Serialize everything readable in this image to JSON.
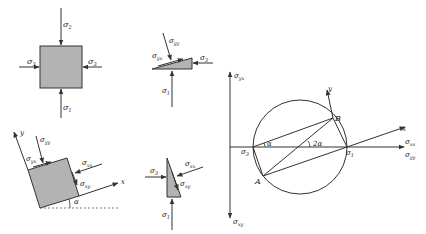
{
  "colors": {
    "stroke": "#333333",
    "fill": "#b3b3b3",
    "background": "#ffffff"
  },
  "panel_a": {
    "top_label": "σ",
    "top_sub": "2",
    "bottom_label": "σ",
    "bottom_sub": "1",
    "left_label": "σ",
    "left_sub": "3",
    "right_label": "σ",
    "right_sub": "3"
  },
  "panel_b": {
    "shear_label": "σ",
    "shear_sub": "yx",
    "normal_label": "σ",
    "normal_sub": "yy",
    "right_label": "σ",
    "right_sub": "3",
    "bottom_label": "σ",
    "bottom_sub": "1"
  },
  "panel_c": {
    "axis_y": "y",
    "axis_x": "x",
    "yy_label": "σ",
    "yy_sub": "yy",
    "yx_label": "σ",
    "yx_sub": "yx",
    "xx_label": "σ",
    "xx_sub": "xx",
    "xy_label": "σ",
    "xy_sub": "xy",
    "angle": "α"
  },
  "panel_d": {
    "left_label": "σ",
    "left_sub": "3",
    "xx_label": "σ",
    "xx_sub": "xx",
    "xy_label": "σ",
    "xy_sub": "xy",
    "bottom_label": "σ",
    "bottom_sub": "1"
  },
  "mohr": {
    "vert_top_label": "σ",
    "vert_top_sub": "yx",
    "vert_bottom_label": "σ",
    "vert_bottom_sub": "xy",
    "horiz_label_1": "σ",
    "horiz_sub_1": "xx",
    "horiz_label_2": "σ",
    "horiz_sub_2": "yy",
    "sigma3": "σ",
    "sigma3_sub": "3",
    "sigma1": "σ",
    "sigma1_sub": "1",
    "point_a": "A",
    "point_b": "B",
    "axis_x": "x",
    "axis_y": "y",
    "angle_alpha": "α",
    "angle_2alpha": "2α"
  }
}
